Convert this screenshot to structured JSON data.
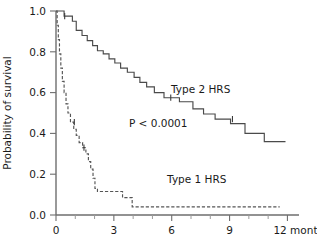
{
  "chart_data": {
    "type": "line",
    "subtype": "kaplan-meier-survival",
    "title": "",
    "xlabel": "",
    "ylabel": "Probability of survival",
    "xlim": [
      0,
      12.6
    ],
    "ylim": [
      0.0,
      1.0
    ],
    "grid": false,
    "legend_position": "inline-annotations",
    "x_unit_label": "12 months",
    "x_ticks": [
      0,
      3,
      6,
      9,
      12
    ],
    "x_tick_labels": [
      "0",
      "3",
      "6",
      "9",
      "12 months"
    ],
    "x_minor_ticks": [
      1,
      2,
      4,
      5,
      7,
      8,
      10,
      11
    ],
    "y_ticks": [
      0.0,
      0.2,
      0.4,
      0.6,
      0.8,
      1.0
    ],
    "y_tick_labels": [
      "0.0",
      "0.2",
      "0.4",
      "0.6",
      "0.8",
      "1.0"
    ],
    "annotations": [
      {
        "name": "p-value",
        "text": "P < 0.0001",
        "x": 5.3,
        "y": 0.43
      },
      {
        "name": "type2-label",
        "text": "Type 2 HRS",
        "x": 7.5,
        "y": 0.6
      },
      {
        "name": "type1-label",
        "text": "Type 1 HRS",
        "x": 7.3,
        "y": 0.155
      }
    ],
    "series": [
      {
        "name": "Type 2 HRS",
        "style": "solid",
        "color": "#4a4a4a",
        "points": [
          [
            0.0,
            1.0
          ],
          [
            0.42,
            1.0
          ],
          [
            0.42,
            0.975
          ],
          [
            0.85,
            0.975
          ],
          [
            0.85,
            0.95
          ],
          [
            1.05,
            0.95
          ],
          [
            1.05,
            0.905
          ],
          [
            1.35,
            0.905
          ],
          [
            1.35,
            0.88
          ],
          [
            1.62,
            0.88
          ],
          [
            1.62,
            0.855
          ],
          [
            1.9,
            0.855
          ],
          [
            1.9,
            0.83
          ],
          [
            2.15,
            0.83
          ],
          [
            2.15,
            0.805
          ],
          [
            2.45,
            0.805
          ],
          [
            2.45,
            0.79
          ],
          [
            2.75,
            0.79
          ],
          [
            2.75,
            0.765
          ],
          [
            3.05,
            0.765
          ],
          [
            3.05,
            0.745
          ],
          [
            3.35,
            0.745
          ],
          [
            3.35,
            0.72
          ],
          [
            3.7,
            0.72
          ],
          [
            3.7,
            0.7
          ],
          [
            4.05,
            0.7
          ],
          [
            4.05,
            0.675
          ],
          [
            4.35,
            0.675
          ],
          [
            4.35,
            0.65
          ],
          [
            4.7,
            0.65
          ],
          [
            4.7,
            0.628
          ],
          [
            5.1,
            0.628
          ],
          [
            5.1,
            0.6
          ],
          [
            5.6,
            0.6
          ],
          [
            5.6,
            0.575
          ],
          [
            6.4,
            0.575
          ],
          [
            6.4,
            0.555
          ],
          [
            7.1,
            0.555
          ],
          [
            7.1,
            0.52
          ],
          [
            7.65,
            0.52
          ],
          [
            7.65,
            0.495
          ],
          [
            8.25,
            0.495
          ],
          [
            8.25,
            0.47
          ],
          [
            9.05,
            0.47
          ],
          [
            9.05,
            0.448
          ],
          [
            9.8,
            0.448
          ],
          [
            9.8,
            0.4
          ],
          [
            10.8,
            0.4
          ],
          [
            10.8,
            0.36
          ],
          [
            11.9,
            0.36
          ]
        ],
        "censored": [
          [
            0.45,
            0.975
          ],
          [
            5.95,
            0.575
          ],
          [
            9.15,
            0.47
          ]
        ],
        "final_survival": 0.36
      },
      {
        "name": "Type 1 HRS",
        "style": "dashed",
        "color": "#555555",
        "points": [
          [
            0.0,
            1.0
          ],
          [
            0.06,
            1.0
          ],
          [
            0.06,
            0.93
          ],
          [
            0.12,
            0.93
          ],
          [
            0.12,
            0.86
          ],
          [
            0.18,
            0.86
          ],
          [
            0.18,
            0.79
          ],
          [
            0.25,
            0.79
          ],
          [
            0.25,
            0.72
          ],
          [
            0.33,
            0.72
          ],
          [
            0.33,
            0.655
          ],
          [
            0.42,
            0.655
          ],
          [
            0.42,
            0.6
          ],
          [
            0.52,
            0.6
          ],
          [
            0.52,
            0.545
          ],
          [
            0.62,
            0.545
          ],
          [
            0.62,
            0.5
          ],
          [
            0.75,
            0.5
          ],
          [
            0.75,
            0.455
          ],
          [
            0.92,
            0.455
          ],
          [
            0.92,
            0.42
          ],
          [
            1.05,
            0.42
          ],
          [
            1.05,
            0.39
          ],
          [
            1.2,
            0.39
          ],
          [
            1.2,
            0.355
          ],
          [
            1.38,
            0.355
          ],
          [
            1.38,
            0.33
          ],
          [
            1.55,
            0.33
          ],
          [
            1.55,
            0.3
          ],
          [
            1.68,
            0.3
          ],
          [
            1.68,
            0.262
          ],
          [
            1.8,
            0.262
          ],
          [
            1.8,
            0.225
          ],
          [
            1.92,
            0.225
          ],
          [
            1.92,
            0.18
          ],
          [
            2.02,
            0.18
          ],
          [
            2.02,
            0.13
          ],
          [
            2.15,
            0.13
          ],
          [
            2.15,
            0.115
          ],
          [
            3.45,
            0.115
          ],
          [
            3.45,
            0.085
          ],
          [
            3.95,
            0.085
          ],
          [
            3.95,
            0.04
          ],
          [
            11.6,
            0.04
          ]
        ],
        "censored": [
          [
            0.95,
            0.455
          ],
          [
            1.45,
            0.33
          ]
        ],
        "final_survival": 0.04
      }
    ]
  },
  "figure": {
    "caption_partial": ""
  }
}
